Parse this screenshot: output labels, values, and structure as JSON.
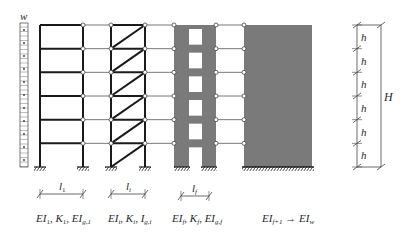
{
  "figure": {
    "load_label": "w",
    "storeys": 6,
    "colors": {
      "line": "#1a1a1a",
      "wall_fill": "#7a7a7a",
      "link": "#555555",
      "dim": "#444444",
      "text": "#2a2a2a"
    },
    "structures": [
      {
        "name": "rigid-frame",
        "span_label": "l",
        "span_sub": "1",
        "props": {
          "a": "EI",
          "a_sub": "1",
          "b": "K",
          "b_sub": "1",
          "c": "EI",
          "c_sub": "g,1"
        }
      },
      {
        "name": "braced-frame",
        "span_label": "l",
        "span_sub": "i",
        "props": {
          "a": "EI",
          "a_sub": "i",
          "b": "K",
          "b_sub": "i",
          "c": "I",
          "c_sub": "g,i"
        }
      },
      {
        "name": "coupled-wall",
        "span_label": "l",
        "span_sub": "f",
        "props": {
          "a": "EI",
          "a_sub": "f",
          "b": "K",
          "b_sub": "f",
          "c": "EI",
          "c_sub": "g,f"
        }
      },
      {
        "name": "shear-wall",
        "props": {
          "a": "EI",
          "a_sub": "f+1",
          "arrow": "→",
          "c": "EI",
          "c_sub": "w"
        }
      }
    ],
    "dimensions": {
      "storey_label": "h",
      "total_label": "H"
    }
  }
}
